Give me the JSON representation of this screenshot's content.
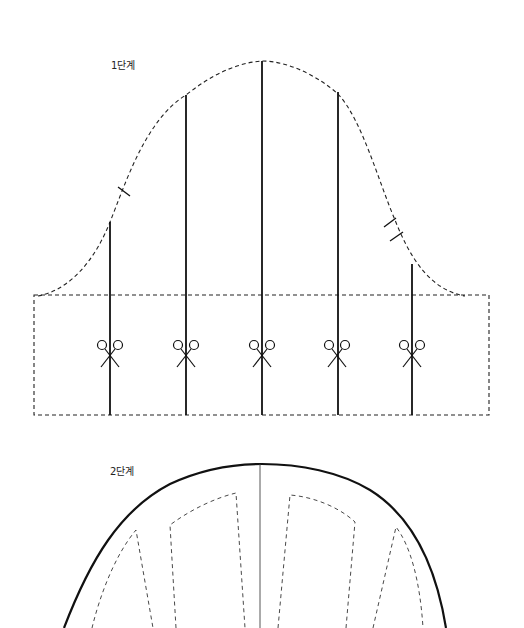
{
  "diagram": {
    "stages": [
      {
        "label": "1단계",
        "description": "Sleeve cap pattern with slash lines and scissor marks",
        "elements": {
          "cap_outline": "dashed curve",
          "band_rectangle": "dashed rectangle",
          "slash_lines": 5,
          "scissor_marks": 5,
          "notches": {
            "front": 1,
            "back": 2
          }
        }
      },
      {
        "label": "2단계",
        "description": "Spread pattern with solid outline, center line and dashed panels",
        "elements": {
          "outline": "solid curve",
          "center_line": "solid thin vertical",
          "panels": "dashed wedges"
        }
      }
    ],
    "icons": [
      "scissors-icon",
      "notch-mark"
    ],
    "colors": {
      "background": "#ffffff",
      "line": "#111111"
    }
  }
}
